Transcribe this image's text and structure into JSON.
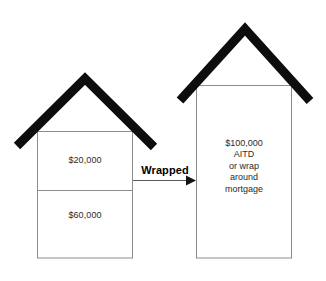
{
  "diagram": {
    "type": "two-house comparison with arrow",
    "colors": {
      "roof": "#0d0d0d",
      "box_outline": "#8a8a8a",
      "text": "#2b2b2b",
      "label_text": "#000000",
      "arrow": "#4d4d4d",
      "background": "#ffffff"
    },
    "left_house": {
      "name": "existing-loans-house",
      "upper_section_label": "$20,000",
      "lower_section_label": "$60,000"
    },
    "arrow": {
      "label": "Wrapped",
      "direction": "left-to-right"
    },
    "right_house": {
      "name": "wrap-around-mortgage-house",
      "lines": [
        "$100,000",
        "AITD",
        "or wrap",
        "around",
        "mortgage"
      ]
    }
  }
}
